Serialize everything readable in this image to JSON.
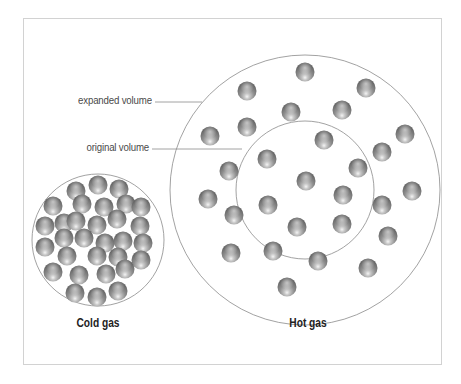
{
  "labels": {
    "expanded_volume": "expanded volume",
    "original_volume": "original volume",
    "cold_gas": "Cold gas",
    "hot_gas": "Hot gas"
  },
  "colors": {
    "frame": "#d2d2d2",
    "circle_outline": "#8a8a8a",
    "leader_line": "#8a8a8a",
    "particle_dark": "#6e6e6e",
    "particle_mid": "#9a9a9a",
    "particle_highlight": "#f0f0f0",
    "label_text": "#4a4a4a",
    "caption_text": "#222222"
  },
  "diagram": {
    "particle_radius": 9.5,
    "cold_gas": {
      "circle": {
        "cx": 98,
        "cy": 240,
        "r": 66
      },
      "particles": [
        [
          76,
          191
        ],
        [
          98,
          185
        ],
        [
          119,
          189
        ],
        [
          53,
          206
        ],
        [
          82,
          204
        ],
        [
          104,
          207
        ],
        [
          126,
          204
        ],
        [
          141,
          207
        ],
        [
          45,
          226
        ],
        [
          64,
          223
        ],
        [
          76,
          221
        ],
        [
          97,
          225
        ],
        [
          117,
          219
        ],
        [
          140,
          226
        ],
        [
          45,
          247
        ],
        [
          64,
          238
        ],
        [
          84,
          238
        ],
        [
          105,
          243
        ],
        [
          123,
          241
        ],
        [
          143,
          243
        ],
        [
          53,
          272
        ],
        [
          67,
          256
        ],
        [
          97,
          256
        ],
        [
          118,
          257
        ],
        [
          141,
          260
        ],
        [
          79,
          275
        ],
        [
          106,
          274
        ],
        [
          125,
          269
        ],
        [
          75,
          293
        ],
        [
          97,
          297
        ],
        [
          118,
          291
        ]
      ]
    },
    "hot_gas": {
      "outer_circle": {
        "cx": 305,
        "cy": 190,
        "r": 135
      },
      "inner_circle": {
        "cx": 305,
        "cy": 190,
        "r": 69
      },
      "particles": [
        [
          305,
          72
        ],
        [
          366,
          88
        ],
        [
          247,
          91
        ],
        [
          342,
          110
        ],
        [
          291,
          112
        ],
        [
          210,
          136
        ],
        [
          247,
          127
        ],
        [
          405,
          134
        ],
        [
          324,
          140
        ],
        [
          267,
          159
        ],
        [
          382,
          152
        ],
        [
          358,
          168
        ],
        [
          229,
          171
        ],
        [
          306,
          181
        ],
        [
          412,
          191
        ],
        [
          208,
          199
        ],
        [
          343,
          195
        ],
        [
          382,
          205
        ],
        [
          234,
          215
        ],
        [
          268,
          205
        ],
        [
          297,
          227
        ],
        [
          342,
          224
        ],
        [
          388,
          236
        ],
        [
          231,
          253
        ],
        [
          273,
          251
        ],
        [
          318,
          261
        ],
        [
          368,
          268
        ],
        [
          287,
          287
        ]
      ]
    },
    "leader_lines": {
      "expanded": {
        "x1": 155,
        "y1": 102,
        "x2": 202,
        "y2": 102
      },
      "original": {
        "x1": 152,
        "y1": 149,
        "x2": 242,
        "y2": 149
      }
    }
  }
}
